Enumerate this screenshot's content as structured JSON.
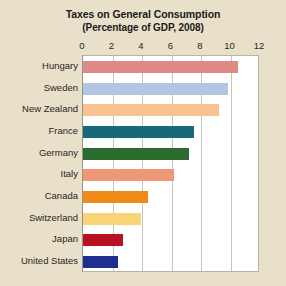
{
  "chart_data": {
    "type": "bar",
    "orientation": "horizontal",
    "title": "Taxes on General Consumption",
    "subtitle": "(Percentage of GDP, 2008)",
    "xlabel": "",
    "ylabel": "",
    "xlim": [
      0,
      12
    ],
    "xticks": [
      0,
      2,
      4,
      6,
      8,
      10,
      12
    ],
    "xtick_labels": [
      "0",
      "2",
      "4",
      "6",
      "8",
      "10",
      "12"
    ],
    "grid": true,
    "legend": "none",
    "categories": [
      "Hungary",
      "Sweden",
      "New Zealand",
      "France",
      "Germany",
      "Italy",
      "Canada",
      "Switzerland",
      "Japan",
      "United States"
    ],
    "values": [
      10.5,
      9.8,
      9.2,
      7.5,
      7.2,
      6.2,
      4.4,
      3.9,
      2.7,
      2.4
    ],
    "bar_colors": [
      "#e08a88",
      "#b3c5e5",
      "#f8c291",
      "#17697a",
      "#2e6b2e",
      "#ee9877",
      "#f08a18",
      "#f7d578",
      "#b81122",
      "#1f2f8f"
    ],
    "plot_background": "#ffffff",
    "figure_background": "#e9e0ca",
    "grid_color": "#c9c5ba",
    "text_color": "#2a2520"
  }
}
